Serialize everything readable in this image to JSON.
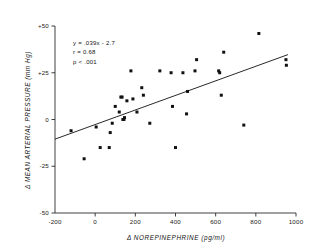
{
  "chart_data": {
    "type": "scatter",
    "title": "",
    "xlabel": "Δ NOREPINEPHRINE (pg/ml)",
    "ylabel": "Δ MEAN ARTERIAL PRESSURE (mm Hg)",
    "xlim": [
      -200,
      1000
    ],
    "ylim": [
      -50,
      50
    ],
    "xticks": [
      -200,
      0,
      200,
      400,
      600,
      800,
      1000
    ],
    "xticklabels": [
      "-200",
      "0",
      "200",
      "400",
      "600",
      "800",
      "1000"
    ],
    "yticks": [
      -50,
      -25,
      0,
      25,
      50
    ],
    "yticklabels": [
      "-50",
      "-25",
      "0",
      "+25",
      "+50"
    ],
    "grid": false,
    "legend": "none",
    "annotations": [
      "y = .039x - 2.7",
      "r = 0.68",
      "p < .001"
    ],
    "fit_line": {
      "slope": 0.039,
      "intercept": -2.7,
      "r": 0.68,
      "p_text": "p < .001",
      "x_start": -200,
      "x_end": 960,
      "y_start": -10.5,
      "y_end": 34.7
    },
    "points": [
      {
        "x": -120,
        "y": -6
      },
      {
        "x": -55,
        "y": -21
      },
      {
        "x": 5,
        "y": -4
      },
      {
        "x": 25,
        "y": -15
      },
      {
        "x": 70,
        "y": -15
      },
      {
        "x": 75,
        "y": -7
      },
      {
        "x": 85,
        "y": -2
      },
      {
        "x": 100,
        "y": 7
      },
      {
        "x": 120,
        "y": 4
      },
      {
        "x": 128,
        "y": 12
      },
      {
        "x": 134,
        "y": 12
      },
      {
        "x": 138,
        "y": 0
      },
      {
        "x": 143,
        "y": 0
      },
      {
        "x": 146,
        "y": 1
      },
      {
        "x": 158,
        "y": 10
      },
      {
        "x": 178,
        "y": 26
      },
      {
        "x": 188,
        "y": 11
      },
      {
        "x": 208,
        "y": 4
      },
      {
        "x": 232,
        "y": 17
      },
      {
        "x": 240,
        "y": 13
      },
      {
        "x": 272,
        "y": -2
      },
      {
        "x": 322,
        "y": 26
      },
      {
        "x": 378,
        "y": 25
      },
      {
        "x": 385,
        "y": 7
      },
      {
        "x": 400,
        "y": -15
      },
      {
        "x": 437,
        "y": 25
      },
      {
        "x": 455,
        "y": 3
      },
      {
        "x": 460,
        "y": 15
      },
      {
        "x": 497,
        "y": 26
      },
      {
        "x": 505,
        "y": 32
      },
      {
        "x": 615,
        "y": 26
      },
      {
        "x": 620,
        "y": 25
      },
      {
        "x": 628,
        "y": 13
      },
      {
        "x": 640,
        "y": 36
      },
      {
        "x": 740,
        "y": -3
      },
      {
        "x": 815,
        "y": 46
      },
      {
        "x": 950,
        "y": 32
      },
      {
        "x": 952,
        "y": 29
      }
    ]
  },
  "figure": {
    "annotation_x_data": -110,
    "annotation_y_data_start": 40
  }
}
